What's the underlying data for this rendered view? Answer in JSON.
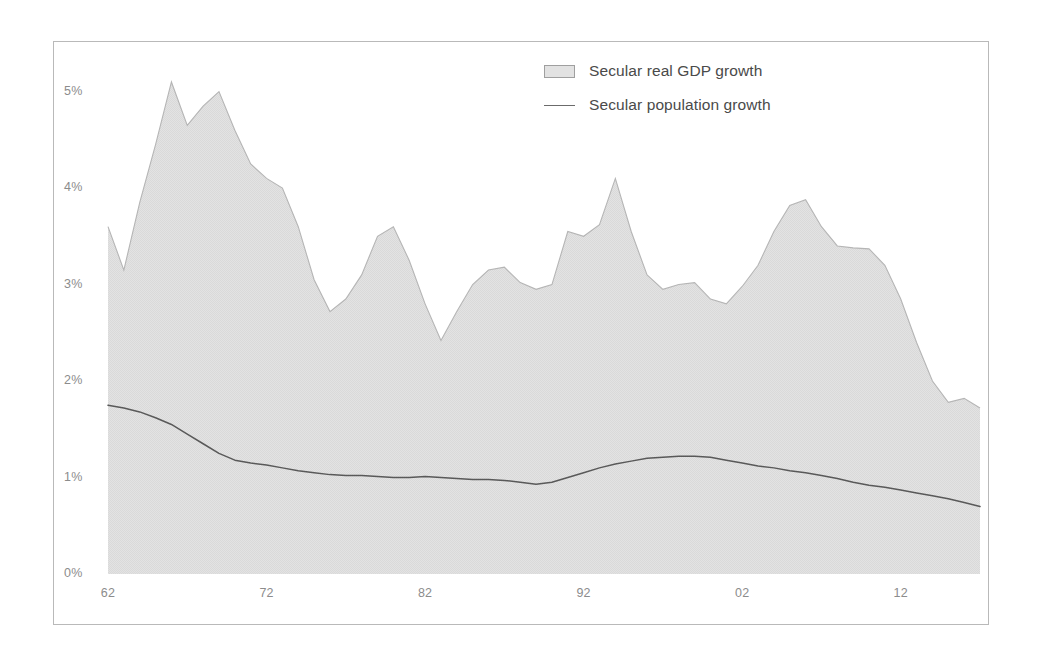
{
  "legend": {
    "position": "top-center-right",
    "items": [
      {
        "label": "Secular real GDP growth",
        "marker": "area-swatch",
        "color": "#e2e2e2"
      },
      {
        "label": "Secular population growth",
        "marker": "line-swatch",
        "color": "#6b6b6b"
      }
    ]
  },
  "axes": {
    "y_ticks": [
      "0%",
      "1%",
      "2%",
      "3%",
      "4%",
      "5%"
    ],
    "x_ticks": [
      "62",
      "72",
      "82",
      "92",
      "02",
      "12"
    ]
  },
  "chart_data": {
    "type": "area",
    "title": "",
    "subtitle": "",
    "xlabel": "",
    "ylabel": "",
    "xlim": [
      1962,
      2017
    ],
    "ylim": [
      0,
      5.4
    ],
    "y_tick_values": [
      0,
      1,
      2,
      3,
      4,
      5
    ],
    "y_tick_labels": [
      "0%",
      "1%",
      "2%",
      "3%",
      "4%",
      "5%"
    ],
    "x_tick_values": [
      1962,
      1972,
      1982,
      1992,
      2002,
      2012
    ],
    "x_tick_labels": [
      "62",
      "72",
      "82",
      "92",
      "02",
      "12"
    ],
    "grid": false,
    "legend_position": "top-right",
    "x": [
      1962,
      1963,
      1964,
      1965,
      1966,
      1967,
      1968,
      1969,
      1970,
      1971,
      1972,
      1973,
      1974,
      1975,
      1976,
      1977,
      1978,
      1979,
      1980,
      1981,
      1982,
      1983,
      1984,
      1985,
      1986,
      1987,
      1988,
      1989,
      1990,
      1991,
      1992,
      1993,
      1994,
      1995,
      1996,
      1997,
      1998,
      1999,
      2000,
      2001,
      2002,
      2003,
      2004,
      2005,
      2006,
      2007,
      2008,
      2009,
      2010,
      2011,
      2012,
      2013,
      2014,
      2015,
      2016,
      2017
    ],
    "series": [
      {
        "name": "Secular real GDP growth",
        "type": "area",
        "color": "#e0e0e0",
        "edge_color": "#bdbdbd",
        "values": [
          3.6,
          3.15,
          3.85,
          4.45,
          5.1,
          4.65,
          4.85,
          5.0,
          4.6,
          4.25,
          4.1,
          4.0,
          3.6,
          3.05,
          2.72,
          2.85,
          3.1,
          3.5,
          3.6,
          3.25,
          2.8,
          2.42,
          2.72,
          3.0,
          3.15,
          3.18,
          3.02,
          2.95,
          3.0,
          3.55,
          3.5,
          3.62,
          4.1,
          3.55,
          3.1,
          2.95,
          3.0,
          3.02,
          2.85,
          2.8,
          2.98,
          3.2,
          3.55,
          3.82,
          3.88,
          3.6,
          3.4,
          3.38,
          3.37,
          3.2,
          2.85,
          2.4,
          2.0,
          1.78,
          1.82,
          1.72
        ]
      },
      {
        "name": "Secular population growth",
        "type": "line",
        "color": "#595959",
        "values": [
          1.75,
          1.72,
          1.68,
          1.62,
          1.55,
          1.45,
          1.35,
          1.25,
          1.18,
          1.15,
          1.13,
          1.1,
          1.07,
          1.05,
          1.03,
          1.02,
          1.02,
          1.01,
          1.0,
          1.0,
          1.01,
          1.0,
          0.99,
          0.98,
          0.98,
          0.97,
          0.95,
          0.93,
          0.95,
          1.0,
          1.05,
          1.1,
          1.14,
          1.17,
          1.2,
          1.21,
          1.22,
          1.22,
          1.21,
          1.18,
          1.15,
          1.12,
          1.1,
          1.07,
          1.05,
          1.02,
          0.99,
          0.95,
          0.92,
          0.9,
          0.87,
          0.84,
          0.81,
          0.78,
          0.74,
          0.7
        ]
      }
    ],
    "tail_points": {
      "gdp_trough": 1.15,
      "gdp_final": 2.1
    }
  }
}
